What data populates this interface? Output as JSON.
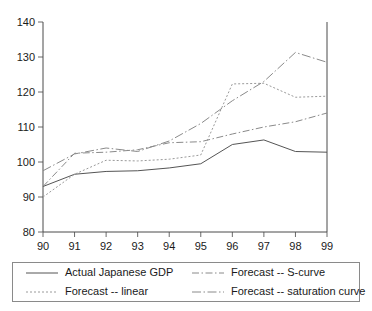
{
  "chart_data": {
    "type": "line",
    "title": "",
    "subtitle": "",
    "xlabel": "",
    "ylabel": "",
    "x": [
      90,
      91,
      92,
      93,
      94,
      95,
      96,
      97,
      98,
      99
    ],
    "xtick_labels": [
      "90",
      "91",
      "92",
      "93",
      "94",
      "95",
      "96",
      "97",
      "98",
      "99"
    ],
    "ytick_labels": [
      "80",
      "90",
      "100",
      "110",
      "120",
      "130",
      "140"
    ],
    "yticks": [
      80,
      90,
      100,
      110,
      120,
      130,
      140
    ],
    "xlim": [
      90,
      99
    ],
    "ylim": [
      80,
      140
    ],
    "grid": false,
    "legend_position": "bottom",
    "series": [
      {
        "name": "Actual Japanese GDP",
        "style": "solid",
        "color": "#555555",
        "dash": "none",
        "values": [
          93.0,
          96.5,
          97.3,
          97.5,
          98.3,
          99.5,
          105.0,
          106.3,
          103.0,
          102.8
        ]
      },
      {
        "name": "Forecast -- S-curve",
        "style": "dash-dot",
        "color": "#8a8a8a",
        "dash": "7,2.5,1.5,2.5",
        "values": [
          93.0,
          102.5,
          102.8,
          103.5,
          105.5,
          105.8,
          108.0,
          110.0,
          111.5,
          114.0
        ]
      },
      {
        "name": "Forecast -- linear",
        "style": "dotted",
        "color": "#9a9a9a",
        "dash": "2,2",
        "values": [
          90.0,
          96.5,
          100.5,
          100.3,
          100.8,
          102.0,
          122.3,
          122.5,
          118.5,
          118.8
        ]
      },
      {
        "name": "Forecast -- saturation curve",
        "style": "long-dash-dot",
        "color": "#8a8a8a",
        "dash": "9,2.5,1.5,2.5",
        "values": [
          97.5,
          102.3,
          104.0,
          103.0,
          106.0,
          111.0,
          117.5,
          123.0,
          131.3,
          128.5
        ]
      }
    ]
  },
  "legend": {
    "entries": [
      {
        "label": "Actual Japanese GDP"
      },
      {
        "label": "Forecast -- S-curve"
      },
      {
        "label": "Forecast -- linear"
      },
      {
        "label": "Forecast -- saturation curve"
      }
    ]
  }
}
